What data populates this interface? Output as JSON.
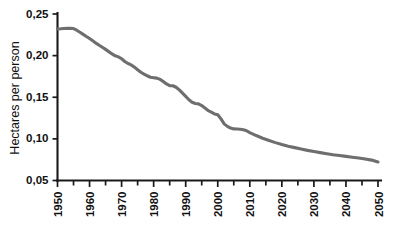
{
  "chart_data": {
    "type": "line",
    "title": "",
    "subtitle": "",
    "xlabel": "",
    "ylabel": "Hectares per person",
    "xlim": [
      1950,
      2050
    ],
    "ylim": [
      0.05,
      0.25
    ],
    "grid": false,
    "legend": null,
    "decimal_separator": ",",
    "x_tick_labels": [
      "1950",
      "1960",
      "1970",
      "1980",
      "1990",
      "2000",
      "2010",
      "2020",
      "2030",
      "2040",
      "2050"
    ],
    "x_tick_values": [
      1950,
      1960,
      1970,
      1980,
      1990,
      2000,
      2010,
      2020,
      2030,
      2040,
      2050
    ],
    "x_minor_tick_values": [
      1955,
      1965,
      1975,
      1985,
      1995,
      2005,
      2015,
      2025,
      2035,
      2045
    ],
    "y_tick_labels": [
      "0,25",
      "0,20",
      "0,15",
      "0,10",
      "0,05"
    ],
    "y_tick_values": [
      0.25,
      0.2,
      0.15,
      0.1,
      0.05
    ],
    "series": [
      {
        "name": "Arable land per person",
        "color": "#6e6e6e",
        "x": [
          1950,
          1951,
          1952,
          1953,
          1954,
          1955,
          1956,
          1957,
          1958,
          1959,
          1960,
          1961,
          1962,
          1963,
          1964,
          1965,
          1966,
          1967,
          1968,
          1969,
          1970,
          1971,
          1972,
          1973,
          1974,
          1975,
          1976,
          1977,
          1978,
          1979,
          1980,
          1981,
          1982,
          1983,
          1984,
          1985,
          1986,
          1987,
          1988,
          1989,
          1990,
          1991,
          1992,
          1993,
          1994,
          1995,
          1996,
          1997,
          1998,
          1999,
          2000,
          2001,
          2002,
          2003,
          2004,
          2005,
          2006,
          2007,
          2008,
          2009,
          2010,
          2012,
          2014,
          2016,
          2018,
          2020,
          2022,
          2024,
          2026,
          2028,
          2030,
          2032,
          2034,
          2036,
          2038,
          2040,
          2042,
          2044,
          2046,
          2048,
          2050
        ],
        "y": [
          0.232,
          0.2322,
          0.2325,
          0.2327,
          0.2328,
          0.2325,
          0.2305,
          0.228,
          0.2255,
          0.223,
          0.2205,
          0.2178,
          0.215,
          0.2125,
          0.21,
          0.2075,
          0.2048,
          0.202,
          0.1998,
          0.1985,
          0.1962,
          0.193,
          0.1905,
          0.1888,
          0.1862,
          0.183,
          0.18,
          0.1778,
          0.1758,
          0.174,
          0.1735,
          0.173,
          0.1715,
          0.169,
          0.166,
          0.164,
          0.1638,
          0.162,
          0.1588,
          0.155,
          0.151,
          0.147,
          0.144,
          0.1425,
          0.142,
          0.14,
          0.137,
          0.134,
          0.132,
          0.13,
          0.129,
          0.124,
          0.118,
          0.115,
          0.113,
          0.112,
          0.1118,
          0.1115,
          0.111,
          0.1098,
          0.1075,
          0.104,
          0.1008,
          0.098,
          0.0955,
          0.0932,
          0.0912,
          0.0895,
          0.0878,
          0.0862,
          0.0848,
          0.0835,
          0.0822,
          0.081,
          0.08,
          0.079,
          0.078,
          0.077,
          0.0758,
          0.0745,
          0.0722
        ]
      }
    ]
  },
  "axis": {
    "y_title": "Hectares per person"
  }
}
